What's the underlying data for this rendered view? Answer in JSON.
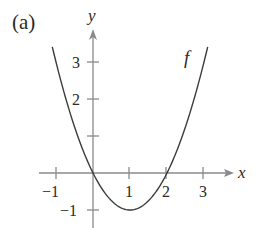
{
  "chart_data": {
    "type": "line",
    "panel_label": "(a)",
    "title": "",
    "xlabel": "x",
    "ylabel": "y",
    "series": [
      {
        "name": "f",
        "function": "f(x) = x^2 - 2x",
        "x": [
          -1.1,
          -1,
          -0.5,
          0,
          0.5,
          1,
          1.5,
          2,
          2.5,
          3,
          3.1
        ],
        "values": [
          3.41,
          3,
          1.25,
          0,
          -0.75,
          -1,
          -0.75,
          0,
          1.25,
          3,
          3.41
        ]
      }
    ],
    "x_ticks": [
      -1,
      1,
      2,
      3
    ],
    "x_tick_labels": [
      "−1",
      "1",
      "2",
      "3"
    ],
    "y_ticks": [
      -1,
      1,
      2,
      3
    ],
    "y_tick_labels": [
      "−1",
      "",
      "2",
      "3"
    ],
    "xlim": [
      -1.45,
      3.8
    ],
    "ylim": [
      -1.5,
      3.8
    ],
    "grid": false,
    "legend": "none (curve labeled inline 'f')",
    "colors": {
      "axes": "#8a8a8a",
      "curve": "#3c3c3c",
      "text": "#2a2a2a"
    }
  },
  "labels": {
    "panel": "(a)",
    "x_axis": "x",
    "y_axis": "y",
    "curve": "f",
    "xt_m1": "−1",
    "xt_1": "1",
    "xt_2": "2",
    "xt_3": "3",
    "yt_m1": "−1",
    "yt_2": "2",
    "yt_3": "3"
  }
}
